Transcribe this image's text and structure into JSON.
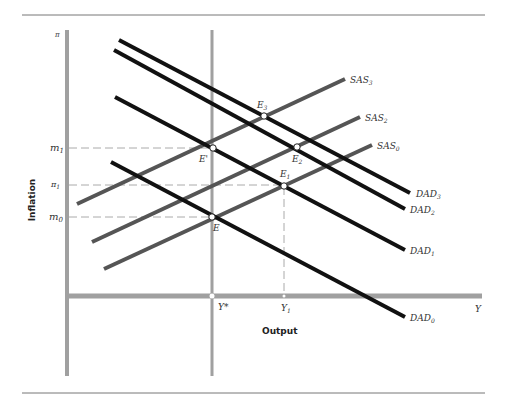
{
  "figure": {
    "y_axis_symbol": "π",
    "y_axis_title": "Inflation",
    "x_axis_symbol": "Y",
    "x_axis_title": "Output",
    "x_ticks": {
      "y_star": "Y*",
      "y1_base": "Y",
      "y1_sub": "1"
    },
    "y_ticks": {
      "m1_base": "m",
      "m1_sub": "1",
      "pi1_base": "π",
      "pi1_sub": "1",
      "m0_base": "m",
      "m0_sub": "0"
    },
    "curves": {
      "SAS3": {
        "base": "SAS",
        "sub": "3"
      },
      "SAS2": {
        "base": "SAS",
        "sub": "2"
      },
      "SAS0": {
        "base": "SAS",
        "sub": "0"
      },
      "DAD3": {
        "base": "DAD",
        "sub": "3"
      },
      "DAD2": {
        "base": "DAD",
        "sub": "2"
      },
      "DAD1": {
        "base": "DAD",
        "sub": "1"
      },
      "DAD0": {
        "base": "DAD",
        "sub": "0"
      }
    },
    "points": {
      "E": {
        "base": "E",
        "sub": ""
      },
      "E_prime": {
        "base": "E'",
        "sub": ""
      },
      "E1": {
        "base": "E",
        "sub": "1"
      },
      "E2": {
        "base": "E",
        "sub": "2"
      },
      "E3": {
        "base": "E",
        "sub": "3"
      }
    },
    "colors": {
      "axis_gray": "#a0a0a0",
      "sas_gray": "#555555",
      "dad_black": "#111111",
      "rule": "#666666"
    }
  }
}
